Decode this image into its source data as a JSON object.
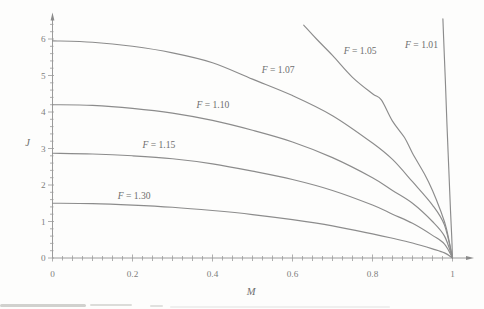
{
  "figure": {
    "background": "#fdfdfc",
    "curve_color": "#8c8c8c",
    "axis_color": "#9a9a9a",
    "text_color": "#6f6f6f"
  },
  "chart_data": {
    "type": "line",
    "title": "",
    "xlabel": "M",
    "ylabel": "J",
    "xlim": [
      0,
      1.05
    ],
    "ylim": [
      0,
      6.7
    ],
    "grid": false,
    "legend_position": "inline-labels",
    "xticks": {
      "labeled_values": [
        0,
        0.2,
        0.4,
        0.6,
        0.8,
        1
      ],
      "labels": [
        "0",
        "0.2",
        "0.4",
        "0.6",
        "0.8",
        "1"
      ],
      "minor_step": 0.025,
      "medium_step": 0.05
    },
    "yticks": {
      "labeled_values": [
        0,
        1,
        2,
        3,
        4,
        5,
        6
      ],
      "labels": [
        "0",
        "1",
        "2",
        "3",
        "4",
        "5",
        "6"
      ],
      "minor_step": 0.2,
      "minor_max": 6.4
    },
    "series": [
      {
        "name": "F = 1.07",
        "label_pos": {
          "m": 0.564,
          "j": 5.15
        },
        "points": [
          [
            0,
            5.95
          ],
          [
            0.1,
            5.91
          ],
          [
            0.2,
            5.8
          ],
          [
            0.3,
            5.62
          ],
          [
            0.4,
            5.35
          ],
          [
            0.5,
            4.9
          ],
          [
            0.6,
            4.45
          ],
          [
            0.7,
            3.9
          ],
          [
            0.8,
            3.15
          ],
          [
            0.85,
            2.7
          ],
          [
            0.9,
            2.09
          ],
          [
            0.95,
            1.45
          ],
          [
            0.98,
            0.9
          ],
          [
            1,
            0
          ]
        ]
      },
      {
        "name": "F = 1.10",
        "label_pos": {
          "m": 0.401,
          "j": 4.21
        },
        "points": [
          [
            0,
            4.2
          ],
          [
            0.1,
            4.18
          ],
          [
            0.2,
            4.1
          ],
          [
            0.3,
            3.97
          ],
          [
            0.4,
            3.77
          ],
          [
            0.5,
            3.5
          ],
          [
            0.6,
            3.18
          ],
          [
            0.7,
            2.75
          ],
          [
            0.8,
            2.2
          ],
          [
            0.85,
            1.85
          ],
          [
            0.9,
            1.5
          ],
          [
            0.95,
            1.0
          ],
          [
            0.98,
            0.6
          ],
          [
            1,
            0
          ]
        ]
      },
      {
        "name": "F = 1.15",
        "label_pos": {
          "m": 0.266,
          "j": 3.1
        },
        "points": [
          [
            0,
            2.87
          ],
          [
            0.1,
            2.85
          ],
          [
            0.2,
            2.8
          ],
          [
            0.3,
            2.72
          ],
          [
            0.4,
            2.58
          ],
          [
            0.5,
            2.38
          ],
          [
            0.6,
            2.15
          ],
          [
            0.7,
            1.85
          ],
          [
            0.8,
            1.45
          ],
          [
            0.85,
            1.2
          ],
          [
            0.9,
            0.95
          ],
          [
            0.95,
            0.62
          ],
          [
            0.98,
            0.38
          ],
          [
            1,
            0
          ]
        ]
      },
      {
        "name": "F = 1.30",
        "label_pos": {
          "m": 0.204,
          "j": 1.71
        },
        "points": [
          [
            0,
            1.5
          ],
          [
            0.1,
            1.49
          ],
          [
            0.2,
            1.45
          ],
          [
            0.3,
            1.39
          ],
          [
            0.4,
            1.3
          ],
          [
            0.5,
            1.19
          ],
          [
            0.6,
            1.05
          ],
          [
            0.7,
            0.88
          ],
          [
            0.8,
            0.66
          ],
          [
            0.85,
            0.54
          ],
          [
            0.9,
            0.41
          ],
          [
            0.95,
            0.25
          ],
          [
            0.98,
            0.14
          ],
          [
            1,
            0
          ]
        ]
      },
      {
        "name": "F = 1.05",
        "label_pos": {
          "m": 0.769,
          "j": 5.67
        },
        "points": [
          [
            0.628,
            6.38
          ],
          [
            0.66,
            6.0
          ],
          [
            0.7,
            5.55
          ],
          [
            0.75,
            4.95
          ],
          [
            0.8,
            4.5
          ],
          [
            0.822,
            4.33
          ],
          [
            0.85,
            3.75
          ],
          [
            0.88,
            3.3
          ],
          [
            0.9,
            2.87
          ],
          [
            0.93,
            2.3
          ],
          [
            0.95,
            1.85
          ],
          [
            0.97,
            1.3
          ],
          [
            0.985,
            0.8
          ],
          [
            1,
            0
          ]
        ]
      },
      {
        "name": "F = 1.01",
        "label_pos": {
          "m": 0.9225,
          "j": 5.84
        },
        "points": [
          [
            0.976,
            6.55
          ],
          [
            0.979,
            5.7
          ],
          [
            0.982,
            4.9
          ],
          [
            0.984,
            4.3
          ],
          [
            0.986,
            3.7
          ],
          [
            0.989,
            2.9
          ],
          [
            0.992,
            2.1
          ],
          [
            0.995,
            1.3
          ],
          [
            0.998,
            0.6
          ],
          [
            1,
            0
          ]
        ]
      }
    ]
  }
}
